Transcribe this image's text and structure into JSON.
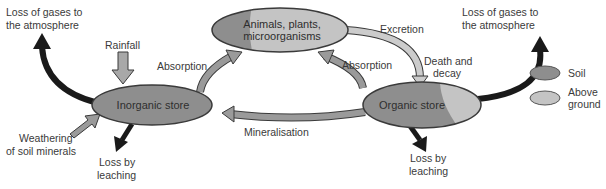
{
  "colors": {
    "soil": "#8e8e8e",
    "above_ground": "#c4c4c4",
    "gas_arrow": "#1a1a1a",
    "flow_arrow": "#9a9a9a",
    "light_arrow": "#c8c8c8",
    "outline": "#3a3a3a",
    "text": "#3a3a3a"
  },
  "nodes": {
    "organisms": {
      "line1": "Animals, plants,",
      "line2": "microorganisms"
    },
    "inorganic": {
      "label": "Inorganic store"
    },
    "organic": {
      "label": "Organic store"
    }
  },
  "labels": {
    "loss_gases_left_1": "Loss of gases to",
    "loss_gases_left_2": "the atmosphere",
    "loss_gases_right_1": "Loss of gases to",
    "loss_gases_right_2": "the atmosphere",
    "rainfall": "Rainfall",
    "absorption_left": "Absorption",
    "absorption_right": "Absorption",
    "excretion": "Excretion",
    "death_decay_1": "Death and",
    "death_decay_2": "decay",
    "weathering_1": "Weathering",
    "weathering_2": "of soil minerals",
    "leaching_left_1": "Loss by",
    "leaching_left_2": "leaching",
    "leaching_right_1": "Loss by",
    "leaching_right_2": "leaching",
    "mineralisation": "Mineralisation"
  },
  "legend": {
    "items": [
      {
        "label": "Soil"
      },
      {
        "label_1": "Above",
        "label_2": "ground"
      }
    ]
  }
}
